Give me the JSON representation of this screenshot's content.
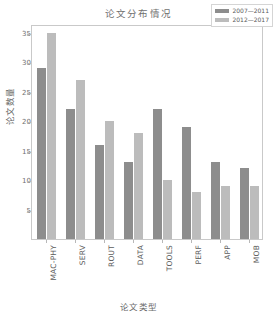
{
  "chart_data": {
    "type": "bar",
    "title": "论文分布情况",
    "xlabel": "论文类型",
    "ylabel": "论文数量",
    "categories": [
      "MAC-PHY",
      "SERV",
      "ROUT",
      "DATA",
      "TOOLS",
      "PERF",
      "APP",
      "MOB"
    ],
    "series": [
      {
        "name": "2007—2011",
        "color": "#8d8d8d",
        "values": [
          29,
          22,
          16,
          13,
          22,
          19,
          13,
          12
        ]
      },
      {
        "name": "2012—2017",
        "color": "#bcbcbc",
        "values": [
          35,
          27,
          20,
          18,
          10,
          8,
          9,
          9
        ]
      }
    ],
    "ylim": [
      0,
      36.5
    ],
    "yticks": [
      5,
      10,
      15,
      20,
      25,
      30,
      35
    ],
    "ytick_labels": [
      "5",
      "10",
      "15",
      "20",
      "25",
      "30",
      "35"
    ],
    "grid": false,
    "legend_position": "top-right"
  }
}
